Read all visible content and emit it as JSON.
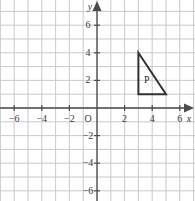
{
  "figure": {
    "type": "coordinate-grid-diagram",
    "width": 195,
    "height": 201,
    "background": "#ffffff",
    "grid_color": "#c9c9d0",
    "axis_color": "#4a4a4a",
    "shape_color": "#333333"
  },
  "axes": {
    "x_axis_label": "x",
    "y_axis_label": "y",
    "origin_label": "O",
    "x_min": -7,
    "x_max": 7,
    "y_min": -7,
    "y_max": 7,
    "x_ticks": [
      -6,
      -4,
      -2,
      2,
      4,
      6
    ],
    "y_ticks": [
      6,
      4,
      2,
      -2,
      -4,
      -6
    ],
    "x_tick_labels": [
      "−6",
      "−4",
      "−2",
      "2",
      "4",
      "6"
    ],
    "y_tick_labels": [
      "6",
      "4",
      "2",
      "−2",
      "−4",
      "−6"
    ],
    "grid_step": 1,
    "pixels_per_unit": 13.8,
    "origin_px": {
      "x": 97,
      "y": 108
    }
  },
  "shapes": [
    {
      "name": "P",
      "label": "P",
      "type": "triangle",
      "vertices": [
        [
          3,
          4
        ],
        [
          3,
          1
        ],
        [
          5,
          1
        ]
      ],
      "label_position": [
        3.6,
        2.0
      ]
    }
  ]
}
